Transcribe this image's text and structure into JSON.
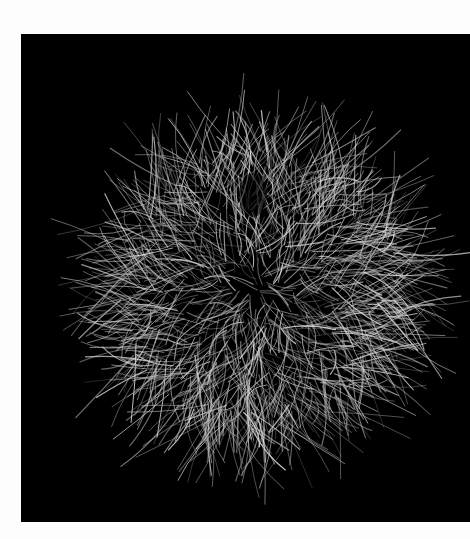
{
  "page": {
    "background": "#fdfdfd"
  },
  "photo": {
    "subject": "spiky hair-like ball",
    "background": "#000000",
    "strand_color": "#d8d8d8",
    "frame": {
      "x": 21,
      "y": 34,
      "width": 449,
      "height": 488
    },
    "ball": {
      "cx": 237,
      "cy": 256,
      "r": 150
    }
  }
}
